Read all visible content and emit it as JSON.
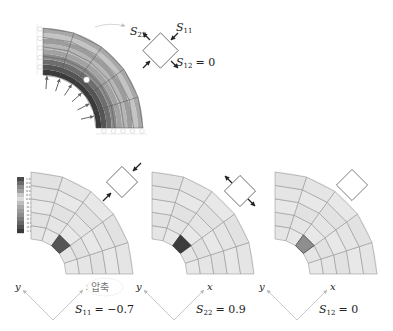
{
  "top_figure": {
    "description": "Quarter cylinder under internal pressure, stress contour",
    "labels": {
      "s22": "S",
      "s22_sub": "22",
      "s11": "S",
      "s11_sub": "11",
      "s12": "S",
      "s12_sub": "12",
      "s12_eq": "= 0"
    },
    "band_colors": [
      "#3a3a3a",
      "#555555",
      "#6e6e6e",
      "#8a8a8a",
      "#a2a2a2",
      "#b6b6b6",
      "#9c9c9c",
      "#c4c4c4",
      "#a8a8a8"
    ]
  },
  "legend": {
    "values": [
      "1.0",
      "0.8",
      "0.6",
      "0.4",
      "0.2",
      "0.0",
      "-0.1",
      "-0.2",
      "-0.3",
      "-0.4",
      "-0.5",
      "-0.6",
      "-0.8",
      "-1.0"
    ],
    "colors": [
      "#4a4a4a",
      "#6a6a6a",
      "#8a8a8a",
      "#a0a0a0",
      "#c8c8c8",
      "#dcdcdc",
      "#bdbdbd",
      "#a9a9a9",
      "#9a9a9a",
      "#8c8c8c",
      "#7a7a7a",
      "#666666",
      "#505050",
      "#3a3a3a"
    ]
  },
  "panels": [
    {
      "id": "s11",
      "axis_y": "y",
      "axis_x": "x",
      "annotation": "압축",
      "eq_symbol": "S",
      "eq_sub": "11",
      "eq_value": "= −0.7",
      "element_color": "#555555",
      "stress_state": "compression"
    },
    {
      "id": "s22",
      "axis_y": "y",
      "axis_x": "x",
      "eq_symbol": "S",
      "eq_sub": "22",
      "eq_value": "= 0.9",
      "element_color": "#3c3c3c",
      "stress_state": "tension"
    },
    {
      "id": "s12",
      "axis_y": "y",
      "axis_x": "x",
      "eq_symbol": "S",
      "eq_sub": "12",
      "eq_value": "= 0",
      "element_color": "#8e8e8e",
      "stress_state": "none"
    }
  ]
}
